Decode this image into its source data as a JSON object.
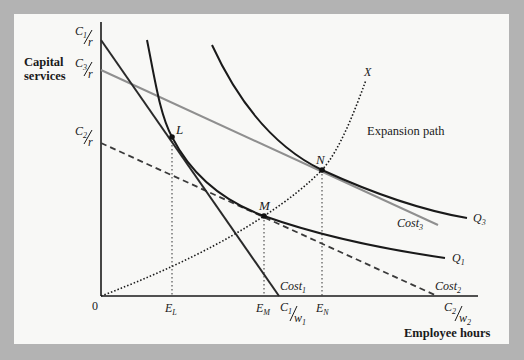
{
  "diagram": {
    "type": "isocost-isoquant diagram",
    "axes": {
      "y_label_line1": "Capital",
      "y_label_line2": "services",
      "x_label": "Employee hours",
      "origin": "0"
    },
    "y_ticks": [
      {
        "num": "C",
        "sub": "1",
        "den": "r"
      },
      {
        "num": "C",
        "sub": "3",
        "den": "r"
      },
      {
        "num": "C",
        "sub": "2",
        "den": "r"
      }
    ],
    "x_ticks": {
      "EL": {
        "base": "E",
        "sub": "L"
      },
      "EM": {
        "base": "E",
        "sub": "M"
      },
      "EN": {
        "base": "E",
        "sub": "N"
      },
      "C1w1": {
        "num": "C",
        "num_sub": "1",
        "den": "w",
        "den_sub": "1"
      },
      "C2w2": {
        "num": "C",
        "num_sub": "2",
        "den": "w",
        "den_sub": "2"
      }
    },
    "lines": {
      "cost1": {
        "base": "Cost",
        "sub": "1",
        "style": "solid",
        "color": "#2a2a2a"
      },
      "cost2": {
        "base": "Cost",
        "sub": "2",
        "style": "dashed",
        "color": "#3a3a3a"
      },
      "cost3": {
        "base": "Cost",
        "sub": "3",
        "style": "solid",
        "color": "#8f8f8f"
      }
    },
    "isoquants": {
      "q1": {
        "base": "Q",
        "sub": "1"
      },
      "q3": {
        "base": "Q",
        "sub": "3"
      }
    },
    "points": {
      "L": "L",
      "M": "M",
      "N": "N"
    },
    "expansion_path": {
      "end_label": "X",
      "label": "Expansion path"
    }
  },
  "colors": {
    "frame": "#b3b3b3",
    "panel": "#f8f8f6",
    "ink": "#1a1a1a",
    "gray_line": "#8f8f8f"
  }
}
